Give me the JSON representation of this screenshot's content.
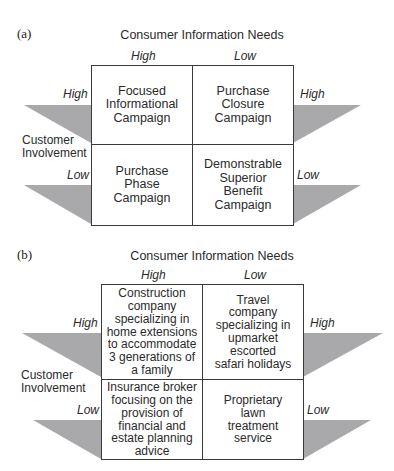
{
  "diagrams": [
    {
      "panel_label": "(a)",
      "title": "Consumer Information Needs",
      "column_headers": [
        "High",
        "Low"
      ],
      "row_axis_label_line1": "Customer",
      "row_axis_label_line2": "Involvement",
      "row_labels_left": [
        "High",
        "Low"
      ],
      "row_labels_right": [
        "High",
        "Low"
      ],
      "cells": [
        [
          "Focused Informational Campaign",
          "Purchase Closure Campaign"
        ],
        [
          "Purchase Phase Campaign",
          "Demonstrable Superior Benefit Campaign"
        ]
      ]
    },
    {
      "panel_label": "(b)",
      "title": "Consumer Information Needs",
      "column_headers": [
        "High",
        "Low"
      ],
      "row_axis_label_line1": "Customer",
      "row_axis_label_line2": "Involvement",
      "row_labels_left": [
        "High",
        "Low"
      ],
      "row_labels_right": [
        "High",
        "Low"
      ],
      "cells": [
        [
          "Construction company specializing in home extensions to accommodate 3 generations of a family",
          "Travel company specializing in upmarket escorted safari holidays"
        ],
        [
          "Insurance broker focusing on the provision of financial and estate planning advice",
          "Proprietary lawn treatment service"
        ]
      ]
    }
  ],
  "colors": {
    "triangle_fill": "#a9a9ab",
    "border": "#3a3a3a",
    "text": "#2a2a2a"
  }
}
